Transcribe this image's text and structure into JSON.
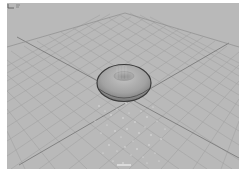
{
  "viewport": {
    "kind": "3d-perspective-viewport",
    "background_color": "#b9b9b9",
    "grid_color": "#a3a3a3",
    "axis_line_color": "#7c7c7c",
    "objects": [
      {
        "name": "torus",
        "color": "#a6a6a6",
        "outline_color": "#3a3a3a"
      },
      {
        "name": "particle-emitter",
        "color": "#e8e8e8"
      }
    ],
    "axis_gizmo": {
      "icon": "xyz-axis-icon"
    },
    "camera_label": ""
  }
}
